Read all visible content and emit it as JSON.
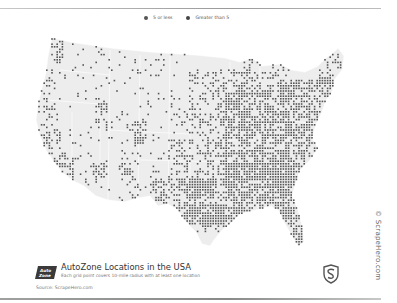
{
  "legend": {
    "items": [
      {
        "label": "5 or less",
        "color": "#555555"
      },
      {
        "label": "Greater than 5",
        "color": "#444444"
      }
    ]
  },
  "title": {
    "heading": "AutoZone Locations in the USA",
    "subtitle": "Each grid point covers 10-mile radius with at least one location",
    "source": "Source: ScrapeHero.com",
    "logo_text_top": "Auto",
    "logo_text_bottom": "Zone"
  },
  "credit": "© ScrapeHero.com",
  "colors": {
    "map_fill": "#ededed",
    "map_border": "#ffffff",
    "dot": "#555555",
    "text": "#333333"
  },
  "map": {
    "dot_size": 1.6,
    "grid_step": 2.6,
    "regions": [
      {
        "name": "washington-west",
        "x": [
          52,
          64
        ],
        "y": [
          40,
          75
        ],
        "density": 0.45
      },
      {
        "name": "oregon-coast",
        "x": [
          40,
          58
        ],
        "y": [
          70,
          110
        ],
        "density": 0.25
      },
      {
        "name": "northwest-interior",
        "x": [
          60,
          110
        ],
        "y": [
          40,
          110
        ],
        "density": 0.06
      },
      {
        "name": "california-north",
        "x": [
          36,
          60
        ],
        "y": [
          110,
          150
        ],
        "density": 0.35
      },
      {
        "name": "california-central",
        "x": [
          40,
          70
        ],
        "y": [
          150,
          175
        ],
        "density": 0.3
      },
      {
        "name": "california-south",
        "x": [
          50,
          75
        ],
        "y": [
          158,
          180
        ],
        "density": 0.6
      },
      {
        "name": "nevada-arizona",
        "x": [
          70,
          140
        ],
        "y": [
          120,
          195
        ],
        "density": 0.08
      },
      {
        "name": "phoenix",
        "x": [
          90,
          104
        ],
        "y": [
          165,
          180
        ],
        "density": 0.55
      },
      {
        "name": "utah-corridor",
        "x": [
          96,
          108
        ],
        "y": [
          100,
          135
        ],
        "density": 0.35
      },
      {
        "name": "mountain-plains",
        "x": [
          110,
          190
        ],
        "y": [
          45,
          160
        ],
        "density": 0.07
      },
      {
        "name": "colorado-front",
        "x": [
          136,
          148
        ],
        "y": [
          120,
          145
        ],
        "density": 0.55
      },
      {
        "name": "new-mexico",
        "x": [
          120,
          165
        ],
        "y": [
          160,
          205
        ],
        "density": 0.12
      },
      {
        "name": "albuquerque",
        "x": [
          122,
          132
        ],
        "y": [
          165,
          177
        ],
        "density": 0.5
      },
      {
        "name": "texas",
        "x": [
          150,
          235
        ],
        "y": [
          180,
          235
        ],
        "density": 0.4
      },
      {
        "name": "dallas",
        "x": [
          190,
          215
        ],
        "y": [
          180,
          200
        ],
        "density": 0.85
      },
      {
        "name": "houston-sanantonio",
        "x": [
          185,
          225
        ],
        "y": [
          205,
          225
        ],
        "density": 0.8
      },
      {
        "name": "oklahoma-kansas",
        "x": [
          170,
          230
        ],
        "y": [
          140,
          185
        ],
        "density": 0.4
      },
      {
        "name": "upper-midwest",
        "x": [
          190,
          250
        ],
        "y": [
          70,
          140
        ],
        "density": 0.35
      },
      {
        "name": "midwest-core",
        "x": [
          225,
          290
        ],
        "y": [
          90,
          180
        ],
        "density": 0.6
      },
      {
        "name": "southeast",
        "x": [
          225,
          310
        ],
        "y": [
          165,
          220
        ],
        "density": 0.65
      },
      {
        "name": "atlanta",
        "x": [
          270,
          290
        ],
        "y": [
          175,
          195
        ],
        "density": 0.9
      },
      {
        "name": "carolinas-virginia",
        "x": [
          280,
          320
        ],
        "y": [
          130,
          180
        ],
        "density": 0.6
      },
      {
        "name": "northeast",
        "x": [
          280,
          335
        ],
        "y": [
          80,
          135
        ],
        "density": 0.55
      },
      {
        "name": "new-england",
        "x": [
          320,
          345
        ],
        "y": [
          55,
          100
        ],
        "density": 0.35
      },
      {
        "name": "florida",
        "x": [
          278,
          303
        ],
        "y": [
          203,
          245
        ],
        "density": 0.7
      },
      {
        "name": "great-lakes",
        "x": [
          245,
          290
        ],
        "y": [
          60,
          100
        ],
        "density": 0.35
      }
    ]
  }
}
